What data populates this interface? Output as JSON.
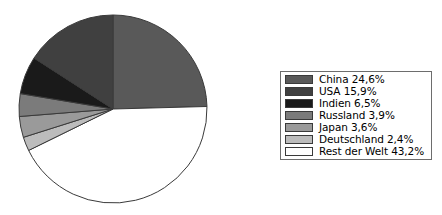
{
  "chart_data": {
    "type": "pie",
    "title": "",
    "subtitle": "",
    "xlabel": "",
    "ylabel": "",
    "grid": false,
    "legend_position": "right",
    "value_unit": "%",
    "decimal_separator": ",",
    "start_angle_deg": 0,
    "direction": "clockwise",
    "categories": [
      "China",
      "USA",
      "Indien",
      "Russland",
      "Japan",
      "Deutschland",
      "Rest der Welt"
    ],
    "values": [
      24.6,
      15.9,
      6.5,
      3.9,
      3.6,
      2.4,
      43.2
    ],
    "labels": [
      "China 24,6%",
      "USA 15,9%",
      "Indien 6,5%",
      "Russland 3,9%",
      "Japan 3,6%",
      "Deutschland 2,4%",
      "Rest der Welt 43,2%"
    ],
    "colors": [
      "#595959",
      "#404040",
      "#1a1a1a",
      "#7b7b7b",
      "#9a9a9a",
      "#bcbcbc",
      "#ffffff"
    ],
    "slice_order_clockwise_from_top": [
      "China",
      "Rest der Welt",
      "Deutschland",
      "Japan",
      "Russland",
      "Indien",
      "USA"
    ],
    "outline_color": "#3a3a3a",
    "total": 100.1
  },
  "legend": {
    "border_color": "#6d6d6d",
    "background": "#ffffff",
    "items": [
      {
        "label": "China 24,6%",
        "color": "#595959",
        "name": "China",
        "value": 24.6
      },
      {
        "label": "USA 15,9%",
        "color": "#404040",
        "name": "USA",
        "value": 15.9
      },
      {
        "label": "Indien 6,5%",
        "color": "#1a1a1a",
        "name": "Indien",
        "value": 6.5
      },
      {
        "label": "Russland 3,9%",
        "color": "#7b7b7b",
        "name": "Russland",
        "value": 3.9
      },
      {
        "label": "Japan 3,6%",
        "color": "#9a9a9a",
        "name": "Japan",
        "value": 3.6
      },
      {
        "label": "Deutschland 2,4%",
        "color": "#bcbcbc",
        "name": "Deutschland",
        "value": 2.4
      },
      {
        "label": "Rest der Welt 43,2%",
        "color": "#ffffff",
        "name": "Rest der Welt",
        "value": 43.2
      }
    ]
  },
  "pie": {
    "center_x": 113,
    "center_y": 109,
    "radius": 94
  }
}
